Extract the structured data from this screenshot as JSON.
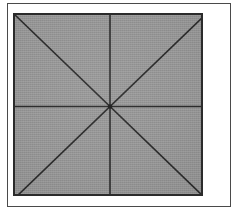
{
  "figure": {
    "kind": "geometric-diagram",
    "background_color": "#ffffff",
    "outer_frame": {
      "name": "page-border",
      "x": 7,
      "y": 3,
      "width": 224,
      "height": 204,
      "stroke_color": "#4a4a4a",
      "stroke_width": 1
    },
    "square": {
      "name": "shaded-square",
      "x": 13,
      "y": 13,
      "width": 190,
      "height": 183,
      "fill_color": "#979797",
      "stroke_color": "#2b2b2b",
      "stroke_width": 2
    },
    "center_point": {
      "x": 95,
      "y": 91.5
    },
    "line_color": "#2b2b2b",
    "line_width": 1.6,
    "lines": [
      {
        "name": "horizontal-midline",
        "x1": 0,
        "y1": 91.5,
        "x2": 190,
        "y2": 91.5
      },
      {
        "name": "vertical-midline",
        "x1": 95,
        "y1": 0,
        "x2": 95,
        "y2": 183
      },
      {
        "name": "diagonal-top-left-to-bottom-right",
        "x1": 0,
        "y1": 0,
        "x2": 190,
        "y2": 183
      },
      {
        "name": "diagonal-top-right-to-bottom-left",
        "x1": 190,
        "y1": 0,
        "x2": 0,
        "y2": 183
      }
    ],
    "sector_count": 8,
    "labels": [],
    "text": []
  }
}
